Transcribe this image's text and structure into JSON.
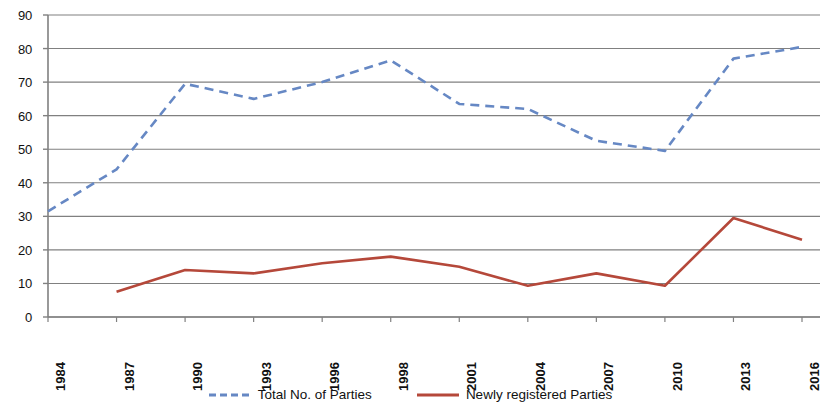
{
  "chart_data": {
    "type": "line",
    "title": "",
    "subtitle": "",
    "xlabel": "",
    "ylabel": "",
    "grid": true,
    "legend_position": "bottom",
    "xlim_categories": true,
    "ylim": [
      0,
      90
    ],
    "ytick_step": 10,
    "yticks": [
      90,
      80,
      70,
      60,
      50,
      40,
      30,
      20,
      10,
      0
    ],
    "categories": [
      "1984",
      "1987",
      "1990",
      "1993",
      "1996",
      "1998",
      "2001",
      "2004",
      "2007",
      "2010",
      "2013",
      "2016"
    ],
    "series": [
      {
        "name": "Total No. of Parties",
        "color": "#6688c4",
        "style": "dashed",
        "values": [
          31.5,
          44,
          69.5,
          65,
          70,
          76.5,
          63.5,
          62,
          52.5,
          49.5,
          77,
          80.5
        ]
      },
      {
        "name": "Newly registered Parties",
        "color": "#b5483a",
        "style": "solid",
        "values": [
          null,
          7.5,
          14,
          13,
          16,
          18,
          15,
          9.3,
          13,
          9.3,
          29.5,
          23
        ]
      }
    ]
  },
  "axis": {
    "y_ticks": [
      "90",
      "80",
      "70",
      "60",
      "50",
      "40",
      "30",
      "20",
      "10",
      "0"
    ],
    "x_ticks": [
      "1984",
      "1987",
      "1990",
      "1993",
      "1996",
      "1998",
      "2001",
      "2004",
      "2007",
      "2010",
      "2013",
      "2016"
    ]
  },
  "legend": {
    "entries": [
      {
        "label": "Total No. of Parties",
        "color": "#6688c4",
        "style": "dashed"
      },
      {
        "label": "Newly registered Parties",
        "color": "#b5483a",
        "style": "solid"
      }
    ]
  },
  "colors": {
    "total_parties": "#6688c4",
    "newly_registered": "#b5483a",
    "gridline": "#808080",
    "axis": "#808080",
    "text": "#111111",
    "background": "#ffffff"
  }
}
